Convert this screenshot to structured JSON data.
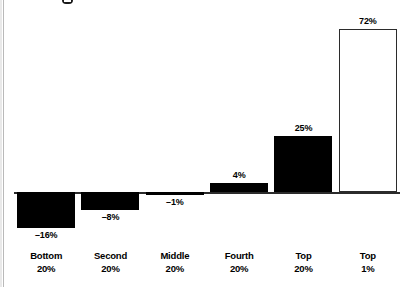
{
  "chart_data": {
    "type": "bar",
    "title": "",
    "xlabel": "",
    "ylabel": "",
    "categories": [
      "Bottom 20%",
      "Second 20%",
      "Middle 20%",
      "Fourth 20%",
      "Top 20%",
      "Top 1%"
    ],
    "category_lines": [
      {
        "line1": "Bottom",
        "line2": "20%"
      },
      {
        "line1": "Second",
        "line2": "20%"
      },
      {
        "line1": "Middle",
        "line2": "20%"
      },
      {
        "line1": "Fourth",
        "line2": "20%"
      },
      {
        "line1": "Top",
        "line2": "20%"
      },
      {
        "line1": "Top",
        "line2": "1%"
      }
    ],
    "values": [
      -16,
      -8,
      -1,
      4,
      25,
      72
    ],
    "value_labels": [
      "–16%",
      "–8%",
      "–1%",
      "4%",
      "25%",
      "72%"
    ],
    "ylim": [
      -16,
      72
    ],
    "grid": false,
    "legend": false,
    "bar_styles": [
      "filled",
      "filled",
      "filled",
      "filled",
      "filled",
      "outline"
    ],
    "colors": {
      "bar_fill": "#000000",
      "bar_outline": "#2b2b2b",
      "hollow_fill": "#ffffff",
      "axis": "#2b2b2b",
      "text": "#000000",
      "background": "#ffffff"
    }
  }
}
